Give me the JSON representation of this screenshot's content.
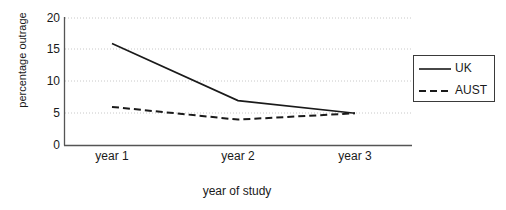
{
  "chart_data": {
    "type": "line",
    "title": "",
    "xlabel": "year of study",
    "ylabel": "percentage outrage",
    "categories": [
      "year 1",
      "year 2",
      "year 3"
    ],
    "series": [
      {
        "name": "UK",
        "values": [
          16,
          7,
          5
        ],
        "style": "solid",
        "color": "#1a1a1a"
      },
      {
        "name": "AUST",
        "values": [
          6,
          4,
          5
        ],
        "style": "dashed",
        "color": "#1a1a1a"
      }
    ],
    "ylim": [
      0,
      20
    ],
    "yticks": [
      0,
      5,
      10,
      15,
      20
    ],
    "grid": "horizontal-dotted",
    "legend_position": "top-right",
    "axis_color": "#555555",
    "grid_color": "#c8c8c8"
  },
  "y_axis": {
    "title": "percentage outrage",
    "ticks": [
      "0",
      "5",
      "10",
      "15",
      "20"
    ]
  },
  "x_axis": {
    "title": "year of study",
    "ticks": [
      "year 1",
      "year 2",
      "year 3"
    ]
  },
  "legend": {
    "entries": [
      {
        "label": "UK",
        "style": "solid"
      },
      {
        "label": "AUST",
        "style": "dashed"
      }
    ]
  }
}
